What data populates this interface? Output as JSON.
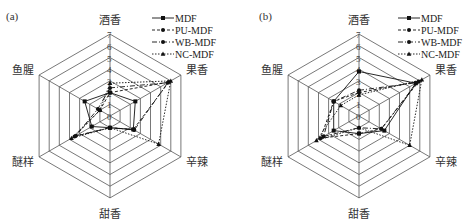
{
  "chart_data": [
    {
      "type": "radar",
      "panel_label": "(a)",
      "axes": [
        "酒香",
        "果香",
        "辛辣",
        "甜香",
        "醚样",
        "鱼腥"
      ],
      "rlim": [
        0,
        7
      ],
      "ticks": [
        "0",
        "1",
        "2",
        "3",
        "4",
        "5",
        "6",
        "7"
      ],
      "grid": true,
      "legend_position": "top-right",
      "series": [
        {
          "name": "MDF",
          "style": "solid",
          "marker": "square",
          "values": [
            2.0,
            2.5,
            2.3,
            1.0,
            1.8,
            2.5
          ]
        },
        {
          "name": "PU-MDF",
          "style": "dashed",
          "marker": "circle",
          "values": [
            2.0,
            5.8,
            2.3,
            1.0,
            3.5,
            1.0
          ]
        },
        {
          "name": "WB-MDF",
          "style": "dashdot",
          "marker": "circle",
          "values": [
            2.4,
            5.7,
            2.4,
            1.0,
            3.4,
            1.2
          ]
        },
        {
          "name": "NC-MDF",
          "style": "dotted",
          "marker": "triangle",
          "values": [
            2.8,
            6.0,
            4.8,
            1.0,
            3.8,
            1.0
          ]
        }
      ]
    },
    {
      "type": "radar",
      "panel_label": "(b)",
      "axes": [
        "酒香",
        "果香",
        "辛辣",
        "甜香",
        "醚样",
        "鱼腥"
      ],
      "rlim": [
        0,
        7
      ],
      "ticks": [
        "0",
        "1",
        "2",
        "3",
        "4",
        "5",
        "6",
        "7"
      ],
      "grid": true,
      "legend_position": "top-right",
      "series": [
        {
          "name": "MDF",
          "style": "solid",
          "marker": "square",
          "values": [
            3.8,
            5.6,
            2.5,
            1.5,
            2.5,
            2.5
          ]
        },
        {
          "name": "PU-MDF",
          "style": "dashed",
          "marker": "circle",
          "values": [
            2.0,
            5.9,
            2.2,
            1.5,
            3.8,
            2.5
          ]
        },
        {
          "name": "WB-MDF",
          "style": "dashdot",
          "marker": "circle",
          "values": [
            2.2,
            5.7,
            2.2,
            1.0,
            3.5,
            2.5
          ]
        },
        {
          "name": "NC-MDF",
          "style": "dotted",
          "marker": "triangle",
          "values": [
            1.8,
            6.2,
            5.0,
            1.0,
            4.2,
            1.8
          ]
        }
      ]
    }
  ]
}
